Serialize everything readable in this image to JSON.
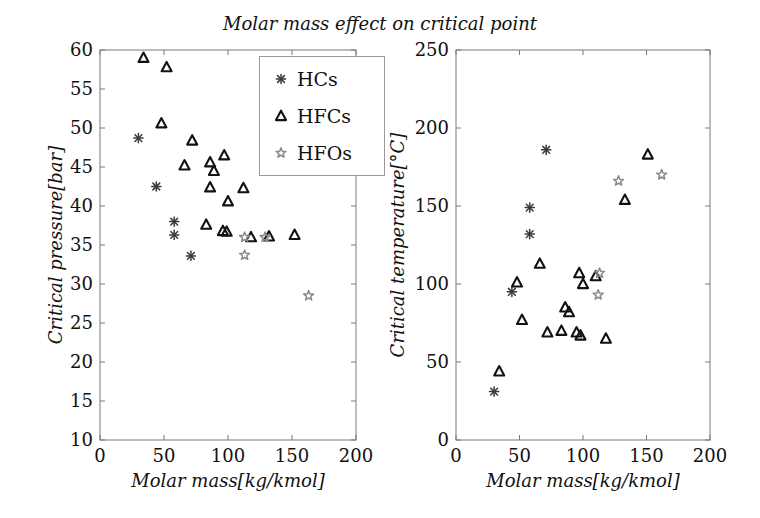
{
  "title": "Molar mass effect on critical point",
  "legend": {
    "items": [
      {
        "label": "HCs",
        "marker": "asterisk"
      },
      {
        "label": "HFCs",
        "marker": "triangle"
      },
      {
        "label": "HFOs",
        "marker": "pentagram"
      }
    ]
  },
  "colors": {
    "hc_marker": "#3a3a3a",
    "hfc_marker": "#111111",
    "hfo_marker": "#8a8a8a",
    "frame": "#7a7a7a",
    "text": "#111111",
    "background": "#ffffff"
  },
  "chart_data": [
    {
      "type": "scatter",
      "xlabel": "Molar mass[kg/kmol]",
      "ylabel": "Critical pressure[bar]",
      "xlim": [
        0,
        200
      ],
      "ylim": [
        10,
        60
      ],
      "xticks": [
        0,
        50,
        100,
        150,
        200
      ],
      "yticks": [
        10,
        15,
        20,
        25,
        30,
        35,
        40,
        45,
        50,
        55,
        60
      ],
      "grid": false,
      "series": [
        {
          "name": "HCs",
          "marker": "asterisk",
          "points": [
            [
              30,
              48.7
            ],
            [
              44,
              42.5
            ],
            [
              58,
              38.0
            ],
            [
              58,
              36.3
            ],
            [
              71,
              33.6
            ]
          ]
        },
        {
          "name": "HFCs",
          "marker": "triangle",
          "points": [
            [
              34,
              59.0
            ],
            [
              52,
              57.8
            ],
            [
              48,
              50.6
            ],
            [
              72,
              48.4
            ],
            [
              66,
              45.2
            ],
            [
              86,
              45.6
            ],
            [
              89,
              44.5
            ],
            [
              97,
              46.5
            ],
            [
              86,
              42.4
            ],
            [
              112,
              42.3
            ],
            [
              100,
              40.6
            ],
            [
              83,
              37.6
            ],
            [
              96,
              36.8
            ],
            [
              99,
              36.7
            ],
            [
              118,
              36.0
            ],
            [
              132,
              36.1
            ],
            [
              152,
              36.3
            ]
          ]
        },
        {
          "name": "HFOs",
          "marker": "pentagram",
          "points": [
            [
              113,
              36.0
            ],
            [
              129,
              36.0
            ],
            [
              113,
              33.7
            ],
            [
              163,
              28.5
            ]
          ]
        }
      ]
    },
    {
      "type": "scatter",
      "xlabel": "Molar mass[kg/kmol]",
      "ylabel": "Critical temperature[°C]",
      "xlim": [
        0,
        200
      ],
      "ylim": [
        0,
        250
      ],
      "xticks": [
        0,
        50,
        100,
        150,
        200
      ],
      "yticks": [
        0,
        50,
        100,
        150,
        200,
        250
      ],
      "grid": false,
      "series": [
        {
          "name": "HCs",
          "marker": "asterisk",
          "points": [
            [
              30,
              31
            ],
            [
              44,
              95
            ],
            [
              58,
              149
            ],
            [
              58,
              132
            ],
            [
              71,
              186
            ]
          ]
        },
        {
          "name": "HFCs",
          "marker": "triangle",
          "points": [
            [
              34,
              44
            ],
            [
              52,
              77
            ],
            [
              48,
              101
            ],
            [
              66,
              113
            ],
            [
              72,
              69
            ],
            [
              83,
              70
            ],
            [
              86,
              85
            ],
            [
              89,
              82
            ],
            [
              95,
              69
            ],
            [
              98,
              67
            ],
            [
              97,
              107
            ],
            [
              100,
              100
            ],
            [
              110,
              105
            ],
            [
              118,
              65
            ],
            [
              133,
              154
            ],
            [
              151,
              183
            ]
          ]
        },
        {
          "name": "HFOs",
          "marker": "pentagram",
          "points": [
            [
              113,
              107
            ],
            [
              112,
              93
            ],
            [
              128,
              166
            ],
            [
              162,
              170
            ]
          ]
        }
      ]
    }
  ]
}
